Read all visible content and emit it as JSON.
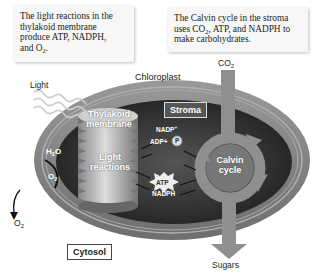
{
  "callouts": {
    "light_reactions": {
      "line1": "The light reactions in the",
      "line2": "thylakoid membrane",
      "line3": "produce ATP, NADPH,",
      "line4_prefix": "and O",
      "line4_sub": "2",
      "line4_suffix": "."
    },
    "calvin_cycle": {
      "line1": "The Calvin cycle in the stroma",
      "line2_prefix": "uses CO",
      "line2_sub": "2",
      "line2_suffix": ", ATP, and NADPH to",
      "line3": "make carbohydrates."
    }
  },
  "labels": {
    "light": "Light",
    "chloroplast": "Chloroplast",
    "co2_prefix": "CO",
    "co2_sub": "2",
    "thylakoid_line1": "Thylakoid",
    "thylakoid_line2": "membrane",
    "stroma": "Stroma",
    "nadp_prefix": "NADP",
    "nadp_sup": "+",
    "adp": "ADP+",
    "phosphate": "P",
    "h2o_prefix": "H",
    "h2o_sub": "2",
    "h2o_suffix": "O",
    "o2_prefix": "O",
    "o2_sub": "2",
    "light_reactions_line1": "Light",
    "light_reactions_line2": "reactions",
    "atp": "ATP",
    "nadph": "NADPH",
    "calvin_line1": "Calvin",
    "calvin_line2": "cycle",
    "o2_out_prefix": "O",
    "o2_out_sub": "2",
    "cytosol": "Cytosol",
    "sugars": "Sugars"
  },
  "colors": {
    "outer_membrane": "#8a8a8a",
    "stroma": "#3a3a3a",
    "thylakoid": "#b5b5b5",
    "calvin_arrow": "#8f8f8f",
    "callout_bg": "#f7f7f7"
  }
}
